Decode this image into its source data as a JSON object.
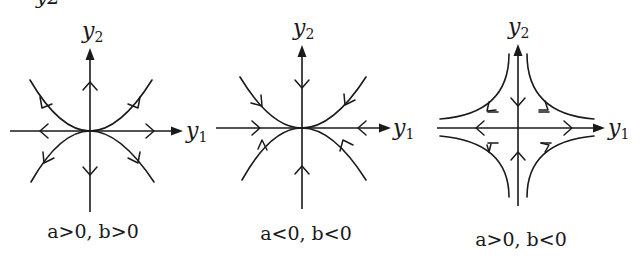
{
  "top_cut_text": "y2",
  "diagrams": [
    {
      "id": "node-source",
      "x_axis_label": "y",
      "x_axis_sub": "1",
      "y_axis_label": "y",
      "y_axis_sub": "2",
      "caption": "a>0, b>0",
      "flow": "outward"
    },
    {
      "id": "node-sink",
      "x_axis_label": "y",
      "x_axis_sub": "1",
      "y_axis_label": "y",
      "y_axis_sub": "2",
      "caption": "a<0, b<0",
      "flow": "inward"
    },
    {
      "id": "saddle",
      "x_axis_label": "y",
      "x_axis_sub": "1",
      "y_axis_label": "y",
      "y_axis_sub": "2",
      "caption": "a>0, b<0",
      "flow": "in along y2, out along y1"
    }
  ]
}
